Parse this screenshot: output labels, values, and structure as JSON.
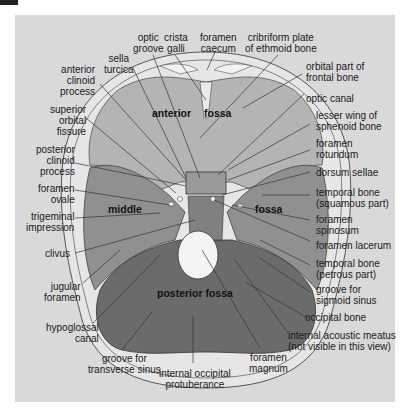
{
  "diagram": {
    "title_regions": {
      "anterior": "anterior",
      "anterior_fossa": "fossa",
      "middle": "middle",
      "middle_fossa": "fossa",
      "posterior": "posterior fossa"
    },
    "colors": {
      "background": "#ffffff",
      "panel": "#d9d9d9",
      "skull_rim": "#e6e6e6",
      "anterior_fossa": "#b4b4b4",
      "middle_fossa": "#8f8f8f",
      "posterior_fossa": "#6a6a6a",
      "foramen_magnum": "#f4f4f4",
      "leader_lines": "#333333"
    },
    "labels": {
      "optic_groove": "optic\ngroove",
      "crista_galli": "crista\ngalli",
      "foramen_caecum": "foramen\ncaecum",
      "cribriform_plate": "cribriform plate\nof ethmoid bone",
      "sella_turcica": "sella\nturcica",
      "anterior_clinoid": "anterior\nclinoid\nprocess",
      "orbital_part": "orbital part of\nfrontal bone",
      "optic_canal": "optic canal",
      "superior_orbital_fissure": "superior\norbital\nfissure",
      "lesser_wing": "lesser wing of\nsphenoid bone",
      "foramen_rotundum": "foramen\nrotundum",
      "posterior_clinoid": "posterior\nclinoid\nprocess",
      "dorsum_sellae": "dorsum sellae",
      "foramen_ovale": "foramen\novale",
      "temporal_squamous": "temporal bone\n(squamous part)",
      "trigeminal_impression": "trigeminal\nimpression",
      "foramen_spinosum": "foramen\nspinosum",
      "foramen_lacerum": "foramen lacerum",
      "clivus": "clivus",
      "temporal_petrous": "temporal bone\n(petrous part)",
      "jugular_foramen": "jugular\nforamen",
      "groove_sigmoid": "groove for\nsigmoid sinus",
      "occipital_bone": "occipital bone",
      "hypoglossal_canal": "hypoglossal\ncanal",
      "internal_acoustic": "internal acoustic meatus\n(not visible in this view)",
      "groove_transverse": "groove for\ntransverse sinus",
      "foramen_magnum": "foramen\nmagnum",
      "internal_occipital": "internal occipital\nprotuberance"
    }
  }
}
